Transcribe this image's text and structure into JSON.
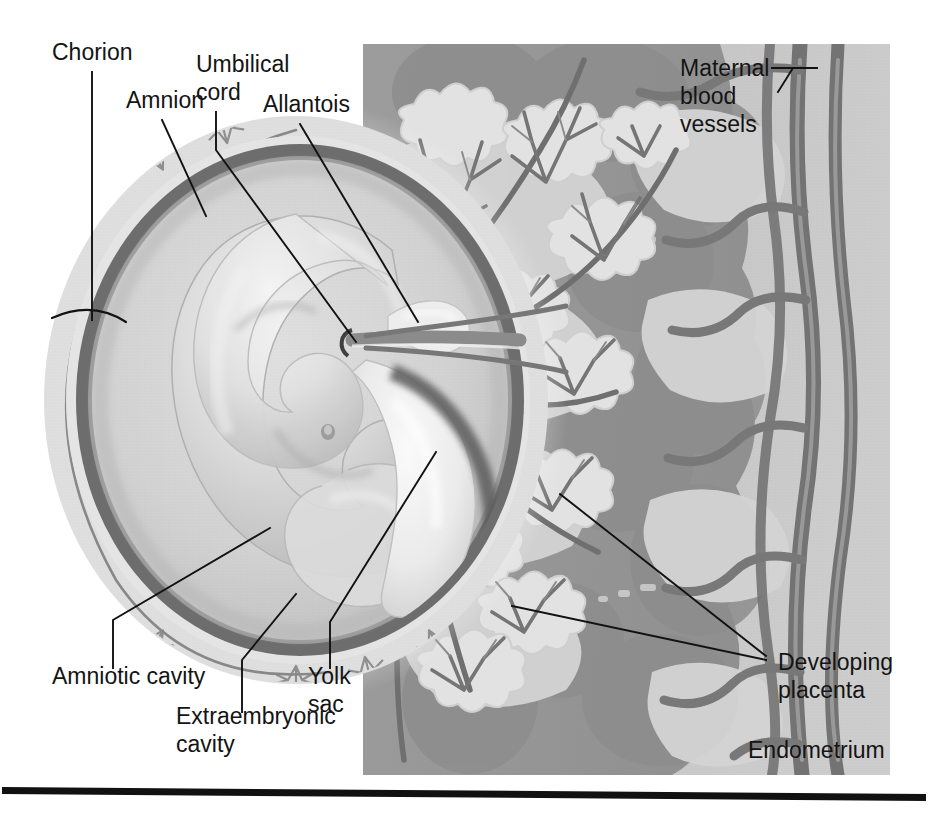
{
  "figure": {
    "kind": "anatomical-illustration",
    "style": "grayscale halftone textbook diagram",
    "canvas": {
      "width": 928,
      "height": 814
    },
    "background_color": "#ffffff"
  },
  "palette": {
    "page_white": "#ffffff",
    "panel_gray": "#c2c2c2",
    "endometrium_dark": "#8e8e8e",
    "endometrium_mid": "#a6a6a6",
    "intervillous_light": "#d2d2d2",
    "vessel_gray": "#7b7b7b",
    "vessel_dark": "#6e6e6e",
    "chorion_pale": "#dcdcdc",
    "amnion_dark": "#6d6d6d",
    "amniotic_fluid": "#cfcfcf",
    "embryo_light": "#e6e6e6",
    "embryo_mid": "#c9c9c9",
    "yolk_sac_pale": "#f0f0f0",
    "label_text": "#141414",
    "leader_line": "#121212",
    "rule_black": "#111111"
  },
  "panel": {
    "name": "uterine-wall-panel",
    "x": 363,
    "y": 44,
    "width": 527,
    "height": 731
  },
  "labels": [
    {
      "id": "chorion",
      "text": "Chorion",
      "text_x": 52,
      "text_y": 60,
      "anchor": "start",
      "leader": "M 92,72 L 92,320",
      "bracket": "M 52,318 Q 92,300 126,322",
      "points_to": "chorion layer with villi at outer margin of conceptus"
    },
    {
      "id": "umbilical-cord",
      "text": "Umbilical",
      "text2": "cord",
      "text_x": 196,
      "text_y": 72,
      "text2_x": 196,
      "text2_y": 100,
      "anchor": "start",
      "leader": "M 216,112 L 216,150 L 356,342",
      "points_to": "umbilical cord at embryo attachment"
    },
    {
      "id": "amnion",
      "text": "Amnion",
      "text_x": 126,
      "text_y": 108,
      "anchor": "start",
      "leader": "M 162,120 L 206,216",
      "points_to": "dark amnion membrane ring"
    },
    {
      "id": "allantois",
      "text": "Allantois",
      "text_x": 263,
      "text_y": 112,
      "anchor": "start",
      "leader": "M 300,124 L 418,322",
      "points_to": "small pale allantois above cord"
    },
    {
      "id": "maternal-blood-vessels",
      "text": "Maternal",
      "text2": "blood",
      "text3": "vessels",
      "text_x": 680,
      "text_y": 76,
      "text2_x": 680,
      "text2_y": 104,
      "text3_x": 680,
      "text3_y": 132,
      "anchor": "start",
      "leader": "M 772,68 L 817,68",
      "leader2": "M 793,68 L 778,92",
      "points_to": "vertical maternal vessels in uterine wall"
    },
    {
      "id": "amniotic-cavity",
      "text": "Amniotic cavity",
      "text_x": 52,
      "text_y": 684,
      "anchor": "start",
      "leader": "M 113,668 L 113,620 L 270,528",
      "points_to": "fluid space between amnion and embryo"
    },
    {
      "id": "extraembryonic-cavity",
      "text": "Extraembryonic",
      "text2": "cavity",
      "text_x": 176,
      "text_y": 724,
      "text2_x": 176,
      "text2_y": 752,
      "anchor": "start",
      "leader": "M 242,712 L 242,660 L 296,594",
      "points_to": "space between amnion and chorion"
    },
    {
      "id": "yolk-sac",
      "text": "Yolk",
      "text2": "sac",
      "text_x": 308,
      "text_y": 684,
      "text2_x": 308,
      "text2_y": 712,
      "anchor": "start",
      "leader": "M 330,668 L 330,622 L 436,452",
      "points_to": "pale tongue-shaped yolk sac"
    },
    {
      "id": "developing-placenta",
      "text": "Developing",
      "text2": "placenta",
      "text_x": 778,
      "text_y": 670,
      "text2_x": 778,
      "text2_y": 698,
      "anchor": "start",
      "leader": "M 560,494 L 766,656",
      "leader2": "M 512,606 L 766,660",
      "points_to": "chorionic villi forming the placenta"
    },
    {
      "id": "endometrium",
      "text": "Endometrium",
      "text_x": 748,
      "text_y": 758,
      "anchor": "start",
      "leader": null,
      "points_to": "uterine lining (label sits directly on tissue)"
    }
  ],
  "footer_rule": {
    "name": "page-rule",
    "x1": 2,
    "y1": 788,
    "x2": 926,
    "y2": 796,
    "thickness": 7
  }
}
